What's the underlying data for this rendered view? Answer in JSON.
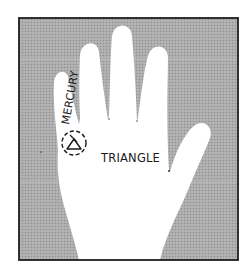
{
  "figure": {
    "labels": {
      "finger_label": "MERCURY",
      "palm_label": "TRIANGLE"
    },
    "symbols": [
      {
        "name": "triangle-sign",
        "glyph": "△",
        "location": "mount of mercury",
        "enclosed_by": "dashed circle"
      }
    ],
    "colors": {
      "background_tone": "#a9a9a9",
      "hand": "#ffffff",
      "frame_border": "#1e1e1e",
      "ink": "#1a1a1a"
    }
  }
}
